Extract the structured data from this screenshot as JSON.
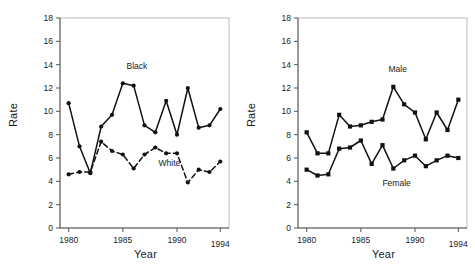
{
  "figure": {
    "background": "#ffffff",
    "ink_color": "#111111"
  },
  "chart_data": [
    {
      "type": "line",
      "panel": "left",
      "title": "",
      "xlabel": "Year",
      "ylabel": "Rate",
      "x": [
        1980,
        1981,
        1982,
        1983,
        1984,
        1985,
        1986,
        1987,
        1988,
        1989,
        1990,
        1991,
        1992,
        1993,
        1994
      ],
      "xlim": [
        1979.2,
        1994.8
      ],
      "ylim": [
        0,
        18
      ],
      "xticks": [
        1980,
        1985,
        1990,
        1994
      ],
      "xticklabels": [
        "1980",
        "1985",
        "1990",
        "1994"
      ],
      "yticks": [
        0,
        2,
        4,
        6,
        8,
        10,
        12,
        14,
        16,
        18
      ],
      "yticklabels": [
        "0",
        "2",
        "4",
        "6",
        "8",
        "10",
        "12",
        "14",
        "16",
        "18"
      ],
      "grid": false,
      "legend_position": "inline-annotation",
      "series": [
        {
          "name": "Black",
          "label": "Black",
          "linestyle": "solid",
          "marker": "circle",
          "color": "#111111",
          "values": [
            10.7,
            7.0,
            4.7,
            8.7,
            9.7,
            12.4,
            12.2,
            8.8,
            8.2,
            10.9,
            8.0,
            12.0,
            8.6,
            8.8,
            10.2
          ],
          "annotation_x": 1986.3,
          "annotation_y": 13.6
        },
        {
          "name": "White",
          "label": "White",
          "linestyle": "dashed",
          "marker": "circle",
          "color": "#111111",
          "values": [
            4.6,
            4.8,
            4.8,
            7.4,
            6.6,
            6.3,
            5.1,
            6.3,
            6.9,
            6.4,
            6.4,
            3.9,
            5.0,
            4.8,
            5.7
          ],
          "annotation_x": 1989.3,
          "annotation_y": 5.3
        }
      ]
    },
    {
      "type": "line",
      "panel": "right",
      "title": "",
      "xlabel": "Year",
      "ylabel": "Rate",
      "x": [
        1980,
        1981,
        1982,
        1983,
        1984,
        1985,
        1986,
        1987,
        1988,
        1989,
        1990,
        1991,
        1992,
        1993,
        1994
      ],
      "xlim": [
        1979.2,
        1994.8
      ],
      "ylim": [
        0,
        18
      ],
      "xticks": [
        1980,
        1985,
        1990,
        1994
      ],
      "xticklabels": [
        "1980",
        "1985",
        "1990",
        "1994"
      ],
      "yticks": [
        0,
        2,
        4,
        6,
        8,
        10,
        12,
        14,
        16,
        18
      ],
      "yticklabels": [
        "0",
        "2",
        "4",
        "6",
        "8",
        "10",
        "12",
        "14",
        "16",
        "18"
      ],
      "grid": false,
      "legend_position": "inline-annotation",
      "series": [
        {
          "name": "Male",
          "label": "Male",
          "linestyle": "solid",
          "marker": "square",
          "color": "#111111",
          "values": [
            8.2,
            6.4,
            6.4,
            9.7,
            8.7,
            8.8,
            9.1,
            9.3,
            12.1,
            10.6,
            9.9,
            7.6,
            9.9,
            8.4,
            11.0
          ],
          "annotation_x": 1988.4,
          "annotation_y": 13.4
        },
        {
          "name": "Female",
          "label": "Female",
          "linestyle": "solid",
          "marker": "square",
          "color": "#111111",
          "values": [
            5.0,
            4.5,
            4.6,
            6.8,
            6.9,
            7.5,
            5.5,
            7.1,
            5.1,
            5.8,
            6.2,
            5.3,
            5.8,
            6.2,
            6.0
          ],
          "annotation_x": 1988.3,
          "annotation_y": 3.6
        }
      ]
    }
  ]
}
